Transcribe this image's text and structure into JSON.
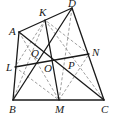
{
  "diagram": {
    "type": "geometry-quadrilateral",
    "points": {
      "A": {
        "x": 19,
        "y": 32,
        "lx": 9,
        "ly": 35
      },
      "K": {
        "x": 45,
        "y": 20,
        "lx": 39,
        "ly": 16
      },
      "D": {
        "x": 72,
        "y": 8,
        "lx": 68,
        "ly": 7
      },
      "B": {
        "x": 13,
        "y": 100,
        "lx": 9,
        "ly": 113
      },
      "M": {
        "x": 59,
        "y": 100,
        "lx": 55,
        "ly": 113
      },
      "C": {
        "x": 104,
        "y": 100,
        "lx": 101,
        "ly": 113
      },
      "L": {
        "x": 15,
        "y": 67,
        "lx": 6,
        "ly": 71
      },
      "N": {
        "x": 89,
        "y": 54,
        "lx": 92,
        "ly": 56
      },
      "O": {
        "x": 52,
        "y": 59,
        "lx": 44,
        "ly": 72
      },
      "Q": {
        "x": 40,
        "y": 56,
        "lx": 31,
        "ly": 57
      },
      "P": {
        "x": 69,
        "y": 63,
        "lx": 68,
        "ly": 69
      }
    },
    "labels": [
      "A",
      "K",
      "D",
      "B",
      "M",
      "C",
      "L",
      "N",
      "O",
      "Q",
      "P"
    ],
    "solid_segments": [
      [
        "A",
        "D"
      ],
      [
        "A",
        "B"
      ],
      [
        "B",
        "C"
      ],
      [
        "C",
        "D"
      ],
      [
        "A",
        "C"
      ],
      [
        "B",
        "D"
      ],
      [
        "K",
        "M"
      ],
      [
        "L",
        "N"
      ]
    ],
    "dashed_segments": [
      [
        "K",
        "L"
      ],
      [
        "L",
        "M"
      ],
      [
        "M",
        "N"
      ],
      [
        "N",
        "K"
      ],
      [
        "A",
        "M"
      ],
      [
        "D",
        "M"
      ],
      [
        "K",
        "B"
      ],
      [
        "K",
        "C"
      ]
    ]
  }
}
